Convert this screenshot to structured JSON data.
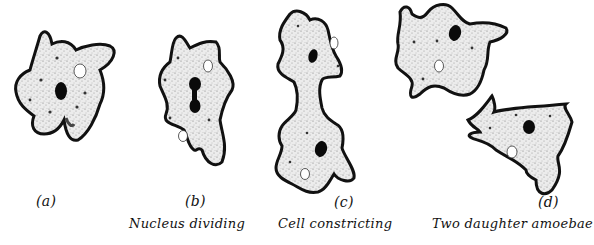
{
  "diagram": {
    "stages": [
      {
        "id": "a",
        "letter": "(a)",
        "caption": ""
      },
      {
        "id": "b",
        "letter": "(b)",
        "caption": "Nucleus dividing"
      },
      {
        "id": "c",
        "letter": "(c)",
        "caption": "Cell constricting"
      },
      {
        "id": "d",
        "letter": "(d)",
        "caption": "Two daughter amoebae"
      }
    ],
    "colors": {
      "outline": "#111111",
      "cytoplasm": "#e4e4e4",
      "nucleus": "#0a0a0a",
      "vacuole": "#ffffff",
      "background": "#ffffff"
    }
  }
}
